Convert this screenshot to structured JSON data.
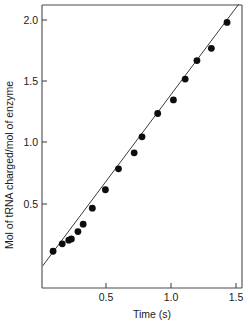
{
  "chart_data": {
    "type": "scatter",
    "title": "",
    "xlabel": "Time (s)",
    "ylabel": "Mol of tRNA charged/mol of enzyme",
    "xlim": [
      0.0,
      1.55
    ],
    "ylim": [
      0.0,
      2.1
    ],
    "grid": false,
    "legend": null,
    "xticks": [
      0.5,
      1.0,
      1.5
    ],
    "xtick_labels": [
      "0.5",
      "1.0",
      "1.5"
    ],
    "yticks": [
      0.5,
      1.0,
      1.5,
      2.0
    ],
    "ytick_labels": [
      "0.5",
      "1.0",
      "1.5",
      "2.0"
    ],
    "marker": "filled-circle",
    "marker_color": "#0d0d0d",
    "line_color": "#3c3c3c",
    "series": [
      {
        "name": "tRNA charging",
        "x": [
          0.1,
          0.17,
          0.22,
          0.24,
          0.29,
          0.33,
          0.4,
          0.5,
          0.6,
          0.72,
          0.78,
          0.9,
          1.02,
          1.11,
          1.2,
          1.31,
          1.43
        ],
        "y": [
          0.12,
          0.18,
          0.21,
          0.22,
          0.28,
          0.34,
          0.47,
          0.62,
          0.79,
          0.92,
          1.05,
          1.24,
          1.35,
          1.52,
          1.67,
          1.77,
          1.98
        ]
      }
    ],
    "fit_line": {
      "x": [
        0.02,
        1.52
      ],
      "y": [
        0.0,
        2.13
      ]
    }
  },
  "axes": {
    "x_axis_label": "Time (s)",
    "y_axis_label": "Mol of tRNA charged/mol of enzyme"
  }
}
